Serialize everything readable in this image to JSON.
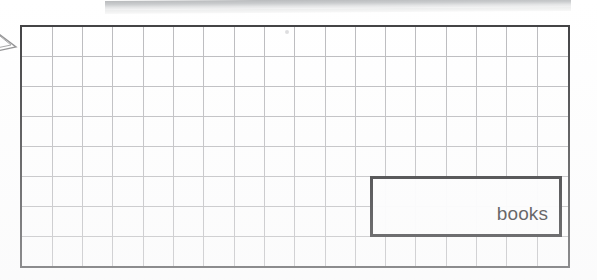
{
  "page": {
    "background_color": "#ffffff",
    "width": 597,
    "height": 280
  },
  "banner": {
    "name": "top-page-edge-strip",
    "color": "#c2c4c6"
  },
  "left_glyph": {
    "icon": "triangle-pointer-icon",
    "color": "#4a4a4c"
  },
  "grid": {
    "name": "grid-paper",
    "columns": 18,
    "rows": 8,
    "cell_width": 30.5,
    "cell_height": 30.2,
    "border_color": "#3c3c3e",
    "border_width": 2,
    "line_color": "#b9b9bc",
    "background_color": "#ffffff"
  },
  "answer_box": {
    "name": "answer-rectangle",
    "label": "books",
    "border_color": "#1b1b1d",
    "border_width": 3,
    "text_align": "right",
    "font_size": 19,
    "text_color": "#19191b"
  },
  "artifacts": {
    "speck_color": "#d6d6d8"
  }
}
